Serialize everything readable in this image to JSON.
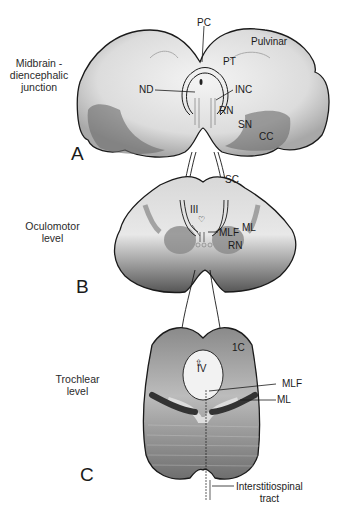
{
  "figure": {
    "sections": [
      {
        "id": "A",
        "panel_letter": "A",
        "level_label": "Midbrain -\ndiencephalic\njunction",
        "labels": [
          "PC",
          "Pulvinar",
          "PT",
          "ND",
          "INC",
          "RN",
          "SN",
          "CC"
        ]
      },
      {
        "id": "B",
        "panel_letter": "B",
        "level_label": "Oculomotor\nlevel",
        "labels": [
          "SC",
          "III",
          "MLF",
          "ML",
          "RN"
        ]
      },
      {
        "id": "C",
        "panel_letter": "C",
        "level_label": "Trochlear\nlevel",
        "labels": [
          "1C",
          "IV",
          "MLF",
          "ML",
          "Interstitiospinal\ntract"
        ]
      }
    ],
    "colors": {
      "outline": "#1a1a1a",
      "light_tissue": "#e6e6e6",
      "mid_tissue": "#b8b8b8",
      "dark_tissue": "#6a6a6a",
      "pathway": "#ffffff"
    }
  }
}
